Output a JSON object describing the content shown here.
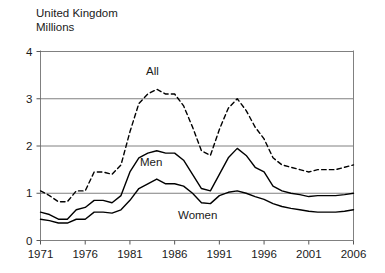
{
  "header": {
    "region": "United Kingdom",
    "units": "Millions"
  },
  "labels": {
    "all": "All",
    "men": "Men",
    "women": "Women"
  },
  "axis": {
    "y_ticks": [
      "0",
      "1",
      "2",
      "3",
      "4"
    ],
    "x_ticks": [
      "1971",
      "1976",
      "1981",
      "1986",
      "1991",
      "1996",
      "2001",
      "2006"
    ]
  },
  "colors": {
    "line": "#000000",
    "grid": "#808080",
    "axis": "#555555",
    "text": "#1a1a1a",
    "background": "#ffffff"
  },
  "chart_data": {
    "type": "line",
    "title": "United Kingdom",
    "subtitle": "Millions",
    "xlabel": "",
    "ylabel": "Millions",
    "xlim": [
      1971,
      2006
    ],
    "ylim": [
      0,
      4
    ],
    "y_ticks": [
      0,
      1,
      2,
      3,
      4
    ],
    "x_ticks": [
      1971,
      1976,
      1981,
      1986,
      1991,
      1996,
      2001,
      2006
    ],
    "grid": "horizontal",
    "legend": "inline-annotations",
    "x": [
      1971,
      1972,
      1973,
      1974,
      1975,
      1976,
      1977,
      1978,
      1979,
      1980,
      1981,
      1982,
      1983,
      1984,
      1985,
      1986,
      1987,
      1988,
      1989,
      1990,
      1991,
      1992,
      1993,
      1994,
      1995,
      1996,
      1997,
      1998,
      1999,
      2000,
      2001,
      2002,
      2003,
      2004,
      2005,
      2006
    ],
    "series": [
      {
        "name": "All",
        "style": "dashed",
        "values": [
          1.05,
          0.95,
          0.82,
          0.82,
          1.05,
          1.05,
          1.45,
          1.45,
          1.4,
          1.6,
          2.3,
          2.9,
          3.1,
          3.2,
          3.1,
          3.1,
          2.85,
          2.4,
          1.9,
          1.8,
          2.35,
          2.8,
          3.0,
          2.75,
          2.4,
          2.15,
          1.75,
          1.6,
          1.55,
          1.5,
          1.45,
          1.5,
          1.5,
          1.5,
          1.55,
          1.6
        ]
      },
      {
        "name": "Men",
        "style": "solid",
        "values": [
          0.6,
          0.55,
          0.45,
          0.45,
          0.65,
          0.7,
          0.85,
          0.85,
          0.8,
          0.95,
          1.45,
          1.75,
          1.85,
          1.9,
          1.85,
          1.85,
          1.7,
          1.4,
          1.1,
          1.05,
          1.4,
          1.75,
          1.95,
          1.8,
          1.55,
          1.45,
          1.15,
          1.05,
          1.0,
          0.97,
          0.93,
          0.95,
          0.95,
          0.95,
          0.97,
          1.0
        ]
      },
      {
        "name": "Women",
        "style": "solid",
        "values": [
          0.45,
          0.42,
          0.37,
          0.37,
          0.45,
          0.45,
          0.6,
          0.6,
          0.58,
          0.65,
          0.85,
          1.1,
          1.2,
          1.3,
          1.2,
          1.2,
          1.15,
          1.0,
          0.8,
          0.78,
          0.95,
          1.02,
          1.05,
          1.0,
          0.93,
          0.87,
          0.78,
          0.72,
          0.68,
          0.65,
          0.62,
          0.6,
          0.6,
          0.6,
          0.62,
          0.65
        ]
      }
    ]
  }
}
